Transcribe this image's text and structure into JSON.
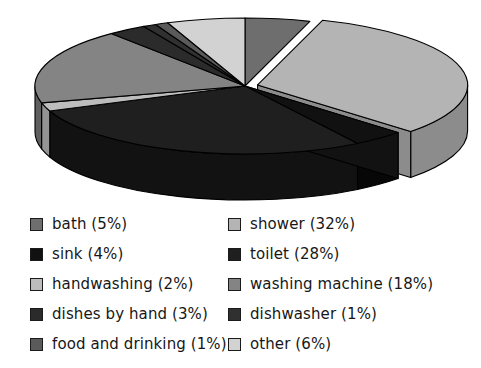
{
  "chart_data": {
    "type": "pie",
    "title": "",
    "subtitle": "",
    "xlabel": "",
    "ylabel": "",
    "style": "3d-exploded-pie",
    "grid": false,
    "legend_position": "bottom",
    "legend_columns": 2,
    "units": "percent",
    "total": 100,
    "categories": [
      "bath",
      "shower",
      "sink",
      "toilet",
      "handwashing",
      "washing machine",
      "dishes by hand",
      "dishwasher",
      "food and drinking",
      "other"
    ],
    "values": [
      5,
      32,
      4,
      28,
      2,
      18,
      3,
      1,
      1,
      6
    ],
    "slices": [
      {
        "label": "bath",
        "value": 5,
        "percent_text": "5%",
        "color": "#6e6e6e",
        "side_color": "#4a4a4a",
        "exploded": false,
        "start_angle": 0,
        "end_angle": 18
      },
      {
        "label": "shower",
        "value": 32,
        "percent_text": "32%",
        "color": "#b4b4b4",
        "side_color": "#8c8c8c",
        "exploded": true,
        "start_angle": 18,
        "end_angle": 133.2
      },
      {
        "label": "sink",
        "value": 4,
        "percent_text": "4%",
        "color": "#111111",
        "side_color": "#070707",
        "exploded": false,
        "start_angle": 133.2,
        "end_angle": 147.6
      },
      {
        "label": "toilet",
        "value": 28,
        "percent_text": "28%",
        "color": "#1f1f1f",
        "side_color": "#121212",
        "exploded": false,
        "start_angle": 147.6,
        "end_angle": 248.4
      },
      {
        "label": "handwashing",
        "value": 2,
        "percent_text": "2%",
        "color": "#bdbdbd",
        "side_color": "#949494",
        "exploded": false,
        "start_angle": 248.4,
        "end_angle": 255.6
      },
      {
        "label": "washing machine",
        "value": 18,
        "percent_text": "18%",
        "color": "#848484",
        "side_color": "#5f5f5f",
        "exploded": false,
        "start_angle": 255.6,
        "end_angle": 320.4
      },
      {
        "label": "dishes by hand",
        "value": 3,
        "percent_text": "3%",
        "color": "#2b2b2b",
        "side_color": "#1a1a1a",
        "exploded": false,
        "start_angle": 320.4,
        "end_angle": 331.2
      },
      {
        "label": "dishwasher",
        "value": 1,
        "percent_text": "1%",
        "color": "#303030",
        "side_color": "#1d1d1d",
        "exploded": false,
        "start_angle": 331.2,
        "end_angle": 334.8
      },
      {
        "label": "food and drinking",
        "value": 1,
        "percent_text": "1%",
        "color": "#5a5a5a",
        "side_color": "#3d3d3d",
        "exploded": false,
        "start_angle": 334.8,
        "end_angle": 338.4
      },
      {
        "label": "other",
        "value": 6,
        "percent_text": "6%",
        "color": "#d2d2d2",
        "side_color": "#a6a6a6",
        "exploded": false,
        "start_angle": 338.4,
        "end_angle": 360
      }
    ]
  },
  "legend": {
    "column_left": [
      {
        "label": "bath (5%)",
        "swatch": "#6e6e6e"
      },
      {
        "label": "sink (4%)",
        "swatch": "#111111"
      },
      {
        "label": "handwashing (2%)",
        "swatch": "#bdbdbd"
      },
      {
        "label": "dishes by hand (3%)",
        "swatch": "#2b2b2b"
      },
      {
        "label": "food and drinking (1%)",
        "swatch": "#5a5a5a"
      }
    ],
    "column_right": [
      {
        "label": "shower (32%)",
        "swatch": "#b4b4b4"
      },
      {
        "label": "toilet (28%)",
        "swatch": "#1f1f1f"
      },
      {
        "label": "washing machine (18%)",
        "swatch": "#848484"
      },
      {
        "label": "dishwasher (1%)",
        "swatch": "#303030"
      },
      {
        "label": "other (6%)",
        "swatch": "#d2d2d2"
      }
    ]
  },
  "geometry": {
    "cx": 245,
    "cy": 86,
    "rx": 210,
    "ry": 68,
    "depth": 46,
    "explode_offset": 13,
    "stroke": "#000000",
    "stroke_width": 1.1,
    "background": "#ffffff"
  }
}
